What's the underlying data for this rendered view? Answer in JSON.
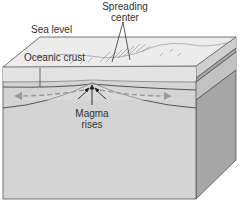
{
  "figure": {
    "labels": {
      "spreading_center_line1": "Spreading",
      "spreading_center_line2": "center",
      "sea_level": "Sea level",
      "oceanic_crust": "Oceanic crust",
      "magma_line1": "Magma",
      "magma_line2": "rises"
    },
    "colors": {
      "top_face": "#e9e9e9",
      "front_face": "#d3d3d3",
      "crust_band": "#e2e2e2",
      "side_face": "#a8a8a8",
      "outline": "#444444",
      "arrow_dashed": "#9a9a9a"
    }
  }
}
